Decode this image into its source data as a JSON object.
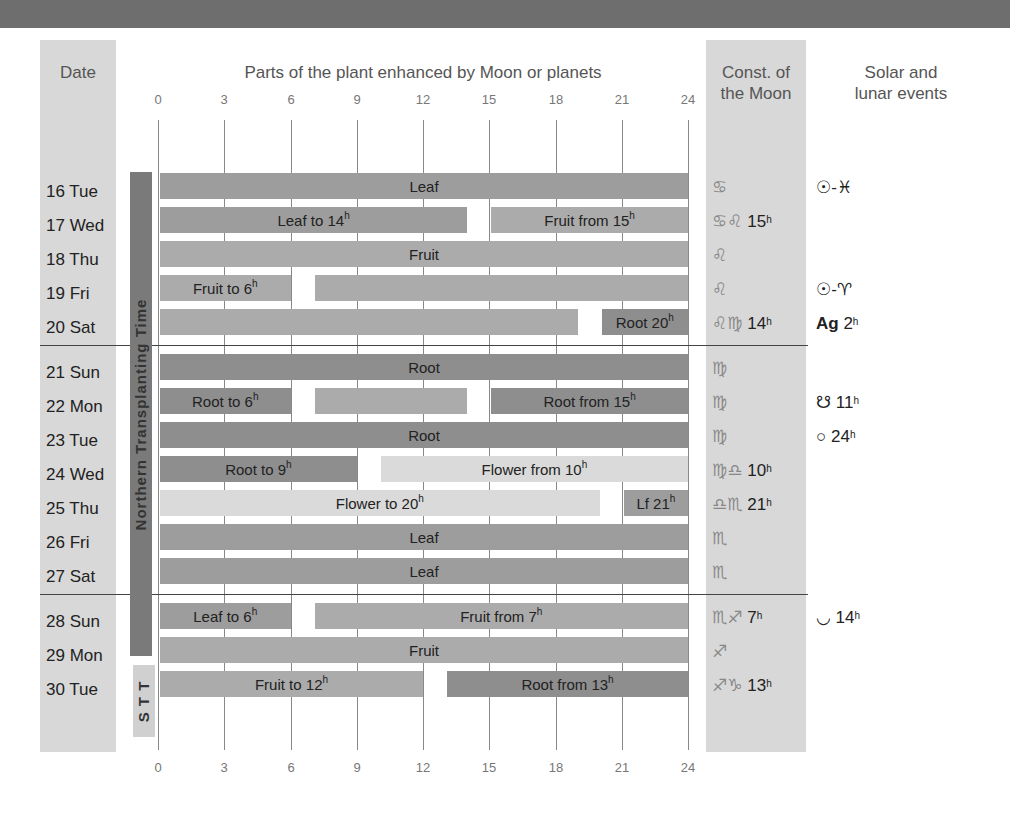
{
  "headers": {
    "date": "Date",
    "parts": "Parts of the plant enhanced by Moon or planets",
    "const_line1": "Const. of",
    "const_line2": "the Moon",
    "events_line1": "Solar and",
    "events_line2": "lunar events"
  },
  "axis": {
    "ticks": [
      "0",
      "3",
      "6",
      "9",
      "12",
      "15",
      "18",
      "21",
      "24"
    ]
  },
  "side_labels": {
    "northern": "Northern Transplanting Time",
    "stt": "S T T"
  },
  "colors": {
    "root": "#8e8e8e",
    "leaf": "#9d9d9d",
    "fruit": "#ababab",
    "flower": "#dadada",
    "column_bg": "#d8d8d8",
    "top_band": "#6e6e6e"
  },
  "rows": [
    {
      "date": "16 Tue",
      "const": "♋",
      "const_time": "",
      "event": "☉-♓",
      "event_time": ""
    },
    {
      "date": "17 Wed",
      "const": "♋♌",
      "const_time": "15",
      "event": "",
      "event_time": ""
    },
    {
      "date": "18 Thu",
      "const": "♌",
      "const_time": "",
      "event": "",
      "event_time": ""
    },
    {
      "date": "19 Fri",
      "const": "♌",
      "const_time": "",
      "event": "☉-♈",
      "event_time": ""
    },
    {
      "date": "20 Sat",
      "const": "♌♍",
      "const_time": "14",
      "event": "Ag",
      "event_time": "2"
    },
    {
      "date": "21 Sun",
      "const": "♍",
      "const_time": "",
      "event": "",
      "event_time": ""
    },
    {
      "date": "22 Mon",
      "const": "♍",
      "const_time": "",
      "event": "☋",
      "event_time": "11"
    },
    {
      "date": "23 Tue",
      "const": "♍",
      "const_time": "",
      "event": "○",
      "event_time": "24"
    },
    {
      "date": "24 Wed",
      "const": "♍♎",
      "const_time": "10",
      "event": "",
      "event_time": ""
    },
    {
      "date": "25 Thu",
      "const": "♎♏",
      "const_time": "21",
      "event": "",
      "event_time": ""
    },
    {
      "date": "26 Fri",
      "const": "♏",
      "const_time": "",
      "event": "",
      "event_time": ""
    },
    {
      "date": "27 Sat",
      "const": "♏",
      "const_time": "",
      "event": "",
      "event_time": ""
    },
    {
      "date": "28 Sun",
      "const": "♏♐",
      "const_time": "7",
      "event": "◡",
      "event_time": "14"
    },
    {
      "date": "29 Mon",
      "const": "♐",
      "const_time": "",
      "event": "",
      "event_time": ""
    },
    {
      "date": "30 Tue",
      "const": "♐♑",
      "const_time": "13",
      "event": "",
      "event_time": ""
    }
  ],
  "chart_data": {
    "type": "bar",
    "subtype": "gantt-timeline",
    "title": "Parts of the plant enhanced by Moon or planets",
    "xlabel": "Hour of day",
    "ylabel": "Date",
    "xlim": [
      0,
      24
    ],
    "xticks": [
      0,
      3,
      6,
      9,
      12,
      15,
      18,
      21,
      24
    ],
    "grid": true,
    "categories": [
      "16 Tue",
      "17 Wed",
      "18 Thu",
      "19 Fri",
      "20 Sat",
      "21 Sun",
      "22 Mon",
      "23 Tue",
      "24 Wed",
      "25 Thu",
      "26 Fri",
      "27 Sat",
      "28 Sun",
      "29 Mon",
      "30 Tue"
    ],
    "segments": [
      {
        "row": 0,
        "start": 0,
        "end": 24,
        "type": "leaf",
        "label": "Leaf",
        "sup": ""
      },
      {
        "row": 1,
        "start": 0,
        "end": 14,
        "type": "leaf",
        "label": "Leaf to 14",
        "sup": "h"
      },
      {
        "row": 1,
        "start": 15,
        "end": 24,
        "type": "fruit",
        "label": "Fruit from 15",
        "sup": "h"
      },
      {
        "row": 2,
        "start": 0,
        "end": 24,
        "type": "fruit",
        "label": "Fruit",
        "sup": ""
      },
      {
        "row": 3,
        "start": 0,
        "end": 6,
        "type": "fruit",
        "label": "Fruit to 6",
        "sup": "h"
      },
      {
        "row": 3,
        "start": 7,
        "end": 24,
        "type": "fruit",
        "label": "",
        "sup": ""
      },
      {
        "row": 4,
        "start": 0,
        "end": 19,
        "type": "fruit",
        "label": "",
        "sup": ""
      },
      {
        "row": 4,
        "start": 20,
        "end": 24,
        "type": "root",
        "label": "Root 20",
        "sup": "h"
      },
      {
        "row": 5,
        "start": 0,
        "end": 24,
        "type": "root",
        "label": "Root",
        "sup": ""
      },
      {
        "row": 6,
        "start": 0,
        "end": 6,
        "type": "root",
        "label": "Root to 6",
        "sup": "h"
      },
      {
        "row": 6,
        "start": 7,
        "end": 14,
        "type": "fruit",
        "label": "",
        "sup": ""
      },
      {
        "row": 6,
        "start": 15,
        "end": 24,
        "type": "root",
        "label": "Root from 15",
        "sup": "h"
      },
      {
        "row": 7,
        "start": 0,
        "end": 24,
        "type": "root",
        "label": "Root",
        "sup": ""
      },
      {
        "row": 8,
        "start": 0,
        "end": 9,
        "type": "root",
        "label": "Root to 9",
        "sup": "h"
      },
      {
        "row": 8,
        "start": 10,
        "end": 24,
        "type": "flower",
        "label": "Flower from 10",
        "sup": "h"
      },
      {
        "row": 9,
        "start": 0,
        "end": 20,
        "type": "flower",
        "label": "Flower to 20",
        "sup": "h"
      },
      {
        "row": 9,
        "start": 21,
        "end": 24,
        "type": "leaf",
        "label": "Lf 21",
        "sup": "h"
      },
      {
        "row": 10,
        "start": 0,
        "end": 24,
        "type": "leaf",
        "label": "Leaf",
        "sup": ""
      },
      {
        "row": 11,
        "start": 0,
        "end": 24,
        "type": "leaf",
        "label": "Leaf",
        "sup": ""
      },
      {
        "row": 12,
        "start": 0,
        "end": 6,
        "type": "leaf",
        "label": "Leaf to 6",
        "sup": "h"
      },
      {
        "row": 12,
        "start": 7,
        "end": 24,
        "type": "fruit",
        "label": "Fruit from 7",
        "sup": "h"
      },
      {
        "row": 13,
        "start": 0,
        "end": 24,
        "type": "fruit",
        "label": "Fruit",
        "sup": ""
      },
      {
        "row": 14,
        "start": 0,
        "end": 12,
        "type": "fruit",
        "label": "Fruit to 12",
        "sup": "h"
      },
      {
        "row": 14,
        "start": 13,
        "end": 24,
        "type": "root",
        "label": "Root from 13",
        "sup": "h"
      }
    ],
    "bands": [
      {
        "label": "Northern Transplanting Time",
        "from_row": 0,
        "to_row": 12
      },
      {
        "label": "S T T",
        "from_row": 13,
        "to_row": 14
      }
    ],
    "week_separators_after_rows": [
      4,
      11
    ]
  }
}
